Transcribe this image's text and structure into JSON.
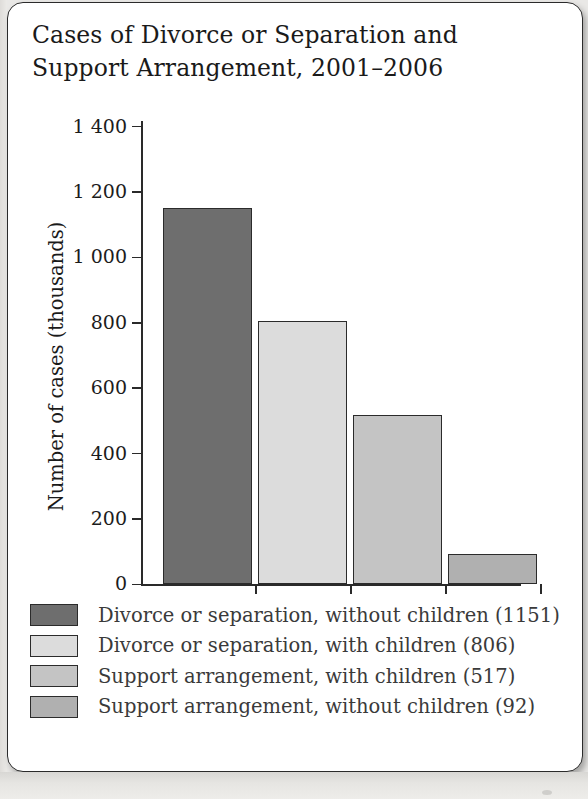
{
  "figure": {
    "title": "Cases of Divorce or Separation and\nSupport Arrangement, 2001–2006"
  },
  "chart_data": {
    "type": "bar",
    "title": "Cases of Divorce or Separation and Support Arrangement, 2001–2006",
    "xlabel": "",
    "ylabel": "Number of cases (thousands)",
    "ylim": [
      0,
      1400
    ],
    "grid": false,
    "legend_position": "below",
    "categories": [
      "Divorce or separation, without children",
      "Divorce or separation, with children",
      "Support arrangement, with children",
      "Support arrangement, without children"
    ],
    "values": [
      1151,
      806,
      517,
      92
    ],
    "bar_colors": [
      "#6e6e6e",
      "#dcdcdc",
      "#c4c4c4",
      "#b0b0b0"
    ],
    "ytick_labels": [
      "0",
      "200",
      "400",
      "600",
      "800",
      "1 000",
      "1 200",
      "1 400"
    ],
    "ytick_values": [
      0,
      200,
      400,
      600,
      800,
      1000,
      1200,
      1400
    ]
  },
  "axes": {
    "y_title": "Number of cases (thousands)",
    "ticks": [
      {
        "label": "1 400",
        "value": 1400
      },
      {
        "label": "1 200",
        "value": 1200
      },
      {
        "label": "1 000",
        "value": 1000
      },
      {
        "label": "800",
        "value": 800
      },
      {
        "label": "600",
        "value": 600
      },
      {
        "label": "400",
        "value": 400
      },
      {
        "label": "200",
        "value": 200
      },
      {
        "label": "0",
        "value": 0
      }
    ]
  },
  "legend": {
    "items": [
      {
        "label": "Divorce or separation, without children (1151)",
        "color": "#6e6e6e",
        "value": 1151
      },
      {
        "label": "Divorce or separation, with children (806)",
        "color": "#dcdcdc",
        "value": 806
      },
      {
        "label": "Support arrangement, with children (517)",
        "color": "#c4c4c4",
        "value": 517
      },
      {
        "label": "Support arrangement, without children (92)",
        "color": "#b0b0b0",
        "value": 92
      }
    ]
  }
}
